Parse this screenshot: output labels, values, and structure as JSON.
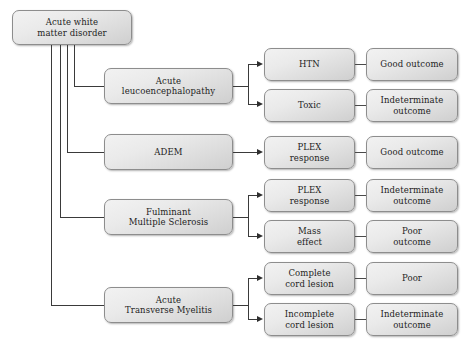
{
  "diagram": {
    "background_color": "#ffffff",
    "box_fill_color": "#e4e4e4",
    "box_border_color": "#8d8d8d",
    "connector_color": "#3a3a3a"
  },
  "root": {
    "label": "Acute white\nmatter disorder"
  },
  "categories": [
    {
      "label": "Acute\nleucoencephalopathy"
    },
    {
      "label": "ADEM"
    },
    {
      "label": "Fulminant\nMultiple Sclerosis"
    },
    {
      "label": "Acute\nTransverse Myelitis"
    }
  ],
  "rows": [
    {
      "condition": "HTN",
      "outcome": "Good outcome"
    },
    {
      "condition": "Toxic",
      "outcome": "Indeterminate\noutcome"
    },
    {
      "condition": "PLEX\nresponse",
      "outcome": "Good outcome"
    },
    {
      "condition": "PLEX\nresponse",
      "outcome": "Indeterminate\noutcome"
    },
    {
      "condition": "Mass\neffect",
      "outcome": "Poor\noutcome"
    },
    {
      "condition": "Complete\ncord lesion",
      "outcome": "Poor"
    },
    {
      "condition": "Incomplete\ncord lesion",
      "outcome": "Indeterminate\noutcome"
    }
  ]
}
